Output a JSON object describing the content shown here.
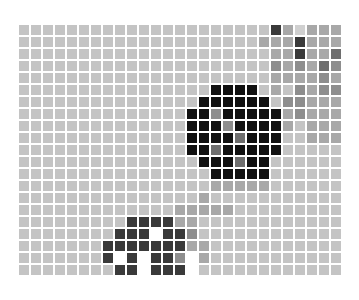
{
  "caption": "~~~ ~~~~",
  "grid": {
    "cols": 27,
    "rows": 21,
    "palette": {
      "0": "#ffffff",
      "1": "#d0d0d0",
      "2": "#c4c4c4",
      "3": "#a8a8a8",
      "4": "#8e8e8e",
      "5": "#6e6e6e",
      "6": "#3a3a3a",
      "7": "#111111"
    },
    "cells": [
      "222222222222222222222631333",
      "222222222222222222223336333",
      "222222222222222222222336335",
      "222222222222222222222434354",
      "222222222222222222222333343",
      "222222222222222277772324344",
      "222222222222222777777244333",
      "222222222222227747777734333",
      "222222222222227774777732333",
      "222222222222227777577722333",
      "222222222222227757777722222",
      "222222222222222777577222222",
      "222222222222222277777222222",
      "222222222222222233333222222",
      "222222222222222322222222222",
      "222222222222233333222222222",
      "222222222666633222222222222",
      "222222226660664222222222222",
      "222222266666663322222222222",
      "222222260606640322222222222",
      "222222226606660222222222222"
    ]
  }
}
